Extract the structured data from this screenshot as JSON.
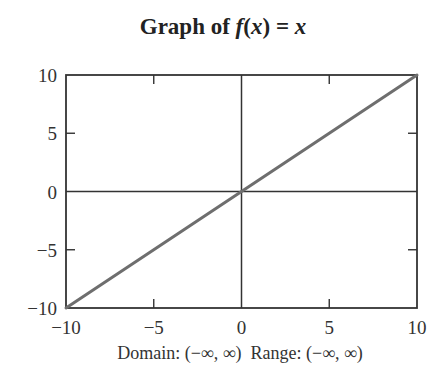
{
  "title": {
    "prefix": "Graph of ",
    "func": "f",
    "open": "(",
    "var": "x",
    "close": ")",
    "eq": " = ",
    "rhs": "x"
  },
  "caption": {
    "domain_label": "Domain:",
    "domain_value": "(−∞, ∞)",
    "range_label": "Range:",
    "range_value": "(−∞, ∞)"
  },
  "colors": {
    "axes": "#333333",
    "line": "#6e6e6e"
  },
  "chart_data": {
    "type": "line",
    "title": "Graph of f(x) = x",
    "xlabel": "Domain: (−∞, ∞)",
    "ylabel": "",
    "annotation": "Range: (−∞, ∞)",
    "xlim": [
      -10,
      10
    ],
    "ylim": [
      -10,
      10
    ],
    "x_ticks": [
      -10,
      -5,
      0,
      5,
      10
    ],
    "y_ticks": [
      -10,
      -5,
      0,
      5,
      10
    ],
    "x_tick_labels": [
      "−10",
      "−5",
      "0",
      "5",
      "10"
    ],
    "y_tick_labels": [
      "−10",
      "−5",
      "0",
      "5",
      "10"
    ],
    "grid": false,
    "legend": null,
    "series": [
      {
        "name": "f(x) = x",
        "x": [
          -10,
          -5,
          0,
          5,
          10
        ],
        "y": [
          -10,
          -5,
          0,
          5,
          10
        ]
      }
    ]
  }
}
